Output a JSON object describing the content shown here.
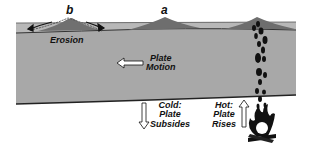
{
  "diagram": {
    "labels": {
      "a": "a",
      "b": "b",
      "erosion": "Erosion",
      "plate_motion": [
        "Plate",
        "Motion"
      ],
      "cold": [
        "Cold:",
        "Plate",
        "Subsides"
      ],
      "hot": [
        "Hot:",
        "Plate",
        "Rises"
      ]
    },
    "icons": {
      "plate_motion_arrow": "left-arrow",
      "subside_arrow": "down-arrow",
      "rise_arrow": "up-arrow",
      "heat_source": "campfire-icon",
      "plume": "rising-drops"
    },
    "colors": {
      "plate": "#a6a6a6",
      "crust_layer": "#b4b4b4",
      "volcano": "#6e6e6e",
      "outline": "#222222",
      "background": "#ffffff"
    }
  }
}
